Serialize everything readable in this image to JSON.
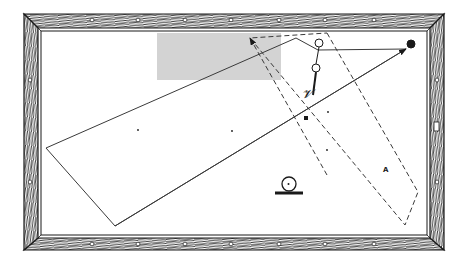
{
  "diagram": {
    "colors": {
      "background": "#ffffff",
      "cloth": "#ffffff",
      "ink": "#1a1a1a",
      "line": "#3a3a3a",
      "highlight": "#d3d3d3",
      "wood": "#ffffff"
    },
    "table": {
      "outer": [
        24,
        14,
        444,
        250
      ],
      "inner": [
        38,
        28,
        428,
        238
      ],
      "diamonds_top": [
        92,
        138,
        185,
        231,
        279,
        325,
        374
      ],
      "diamonds_bottom": [
        92,
        138,
        185,
        231,
        279,
        325,
        374
      ],
      "diamonds_left": [
        80,
        182
      ],
      "diamonds_right": [
        80,
        182
      ]
    },
    "highlight_region": {
      "x": 157,
      "y": 33,
      "width": 124,
      "height": 47
    },
    "solid_polygon": [
      [
        46,
        148
      ],
      [
        296,
        38
      ],
      [
        318,
        50
      ],
      [
        406,
        49
      ],
      [
        115,
        226
      ]
    ],
    "dashed_polygon": [
      [
        327,
        33
      ],
      [
        418,
        192
      ],
      [
        405,
        225
      ],
      [
        250,
        38
      ]
    ],
    "arrows": [
      {
        "name": "solid-cue-path",
        "from": [
          115,
          226
        ],
        "to": [
          406,
          49
        ],
        "style": "solid"
      },
      {
        "name": "dashed-object-path",
        "from": [
          327,
          175
        ],
        "to": [
          250,
          38
        ],
        "style": "dashed"
      }
    ],
    "balls": [
      {
        "name": "object-ball-top",
        "cx": 319,
        "cy": 43,
        "r": 4,
        "fill": "none"
      },
      {
        "name": "object-ball-lower",
        "cx": 316,
        "cy": 68,
        "r": 4,
        "fill": "none"
      },
      {
        "name": "target-ball",
        "cx": 411,
        "cy": 44,
        "r": 4,
        "fill": "#1a1a1a"
      }
    ],
    "cue_stick": {
      "from": [
        316,
        72
      ],
      "to": [
        313,
        95
      ]
    },
    "hand_glyph_label": "𝓥",
    "markers": [
      {
        "type": "dot",
        "x": 138,
        "y": 130
      },
      {
        "type": "dot",
        "x": 232,
        "y": 131
      },
      {
        "type": "dot",
        "x": 328,
        "y": 112
      },
      {
        "type": "dot",
        "x": 327,
        "y": 150
      },
      {
        "type": "square",
        "x": 306,
        "y": 118
      }
    ],
    "spot_label": "A",
    "spot_position": [
      383,
      172
    ],
    "cue_ball_symbol": {
      "cx": 289,
      "cy": 184,
      "r": 7,
      "base_x1": 275,
      "base_x2": 303,
      "base_y": 193
    }
  }
}
